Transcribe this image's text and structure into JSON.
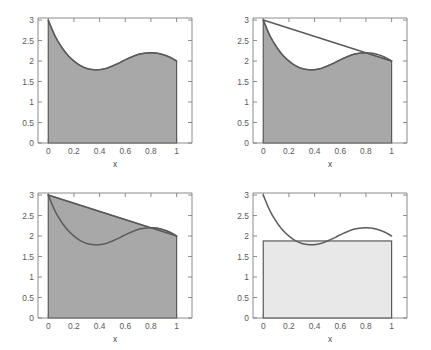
{
  "figure": {
    "background": "#ffffff",
    "panel_count": 4,
    "fill_dark": "#a8a8a8",
    "fill_light": "#e8e8e8",
    "curve_color": "#5a5a5a",
    "axis_color": "#808080"
  },
  "axes": {
    "xlabel": "x",
    "ylabel": "",
    "xticks": [
      "0",
      "0.2",
      "0.4",
      "0.6",
      "0.8",
      "1"
    ],
    "xtick_values": [
      0,
      0.2,
      0.4,
      0.6,
      0.8,
      1
    ],
    "yticks": [
      "0",
      "0.5",
      "1",
      "1.5",
      "2",
      "2.5",
      "3"
    ],
    "ytick_values": [
      0,
      0.5,
      1,
      1.5,
      2,
      2.5,
      3
    ],
    "xlim": [
      -0.08,
      1.12
    ],
    "ylim": [
      0,
      3.05
    ]
  },
  "chart_data": [
    {
      "type": "area",
      "panel": "top-left",
      "title": "",
      "xlabel": "x",
      "ylabel": "",
      "xlim": [
        -0.08,
        1.12
      ],
      "ylim": [
        0,
        3.05
      ],
      "grid": false,
      "legend": null,
      "series": [
        {
          "name": "curve",
          "style": "line-with-fill",
          "fill": "#a8a8a8",
          "x": [
            0.0,
            0.05,
            0.1,
            0.15,
            0.2,
            0.25,
            0.3,
            0.35,
            0.4,
            0.45,
            0.5,
            0.55,
            0.6,
            0.65,
            0.7,
            0.75,
            0.8,
            0.85,
            0.9,
            0.95,
            1.0
          ],
          "y": [
            3.0,
            2.63,
            2.36,
            2.15,
            2.0,
            1.89,
            1.82,
            1.79,
            1.79,
            1.82,
            1.88,
            1.95,
            2.03,
            2.1,
            2.16,
            2.19,
            2.2,
            2.19,
            2.15,
            2.09,
            2.0
          ]
        }
      ]
    },
    {
      "type": "area",
      "panel": "top-right",
      "title": "",
      "xlabel": "x",
      "ylabel": "",
      "xlim": [
        -0.08,
        1.12
      ],
      "ylim": [
        0,
        3.05
      ],
      "grid": false,
      "legend": null,
      "shaded": "minimum of curve and chord (lower envelope)",
      "series": [
        {
          "name": "curve",
          "style": "line",
          "x": [
            0.0,
            0.05,
            0.1,
            0.15,
            0.2,
            0.25,
            0.3,
            0.35,
            0.4,
            0.45,
            0.5,
            0.55,
            0.6,
            0.65,
            0.7,
            0.75,
            0.8,
            0.85,
            0.9,
            0.95,
            1.0
          ],
          "y": [
            3.0,
            2.63,
            2.36,
            2.15,
            2.0,
            1.89,
            1.82,
            1.79,
            1.79,
            1.82,
            1.88,
            1.95,
            2.03,
            2.1,
            2.16,
            2.19,
            2.2,
            2.19,
            2.15,
            2.09,
            2.0
          ]
        },
        {
          "name": "chord",
          "style": "line",
          "x": [
            0.0,
            1.0
          ],
          "y": [
            3.0,
            2.0
          ]
        }
      ]
    },
    {
      "type": "area",
      "panel": "bottom-left",
      "title": "",
      "xlabel": "x",
      "ylabel": "",
      "xlim": [
        -0.08,
        1.12
      ],
      "ylim": [
        0,
        3.05
      ],
      "grid": false,
      "legend": null,
      "shaded": "maximum of curve and chord (upper envelope)",
      "series": [
        {
          "name": "curve",
          "style": "line",
          "x": [
            0.0,
            0.05,
            0.1,
            0.15,
            0.2,
            0.25,
            0.3,
            0.35,
            0.4,
            0.45,
            0.5,
            0.55,
            0.6,
            0.65,
            0.7,
            0.75,
            0.8,
            0.85,
            0.9,
            0.95,
            1.0
          ],
          "y": [
            3.0,
            2.63,
            2.36,
            2.15,
            2.0,
            1.89,
            1.82,
            1.79,
            1.79,
            1.82,
            1.88,
            1.95,
            2.03,
            2.1,
            2.16,
            2.19,
            2.2,
            2.19,
            2.15,
            2.09,
            2.0
          ]
        },
        {
          "name": "chord",
          "style": "line",
          "x": [
            0.0,
            1.0
          ],
          "y": [
            3.0,
            2.0
          ]
        }
      ]
    },
    {
      "type": "area",
      "panel": "bottom-right",
      "title": "",
      "xlabel": "x",
      "ylabel": "",
      "xlim": [
        -0.08,
        1.12
      ],
      "ylim": [
        0,
        3.05
      ],
      "grid": false,
      "legend": null,
      "shaded": "constant level rectangle below curve minimum",
      "series": [
        {
          "name": "curve",
          "style": "line",
          "x": [
            0.0,
            0.05,
            0.1,
            0.15,
            0.2,
            0.25,
            0.3,
            0.35,
            0.4,
            0.45,
            0.5,
            0.55,
            0.6,
            0.65,
            0.7,
            0.75,
            0.8,
            0.85,
            0.9,
            0.95,
            1.0
          ],
          "y": [
            3.0,
            2.63,
            2.36,
            2.15,
            2.0,
            1.89,
            1.82,
            1.79,
            1.79,
            1.82,
            1.88,
            1.95,
            2.03,
            2.1,
            2.16,
            2.19,
            2.2,
            2.19,
            2.15,
            2.09,
            2.0
          ]
        },
        {
          "name": "constant-level",
          "style": "horizontal-line-with-fill",
          "fill": "#e8e8e8",
          "value": 1.88,
          "x": [
            0.0,
            1.0
          ],
          "y": [
            1.88,
            1.88
          ]
        }
      ]
    }
  ]
}
